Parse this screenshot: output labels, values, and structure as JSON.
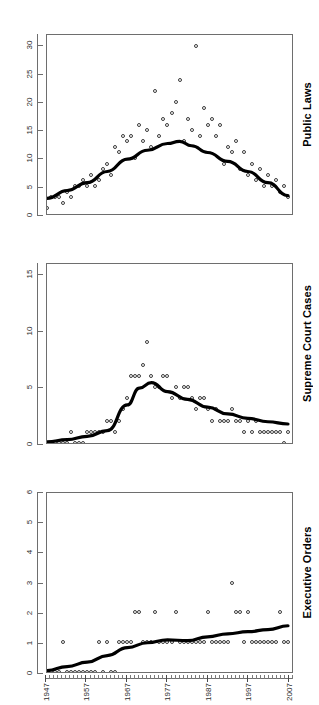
{
  "figure": {
    "orientation_note": "rotated-90",
    "background_color": "#ffffff",
    "point_color": "#3b3b3b",
    "trend_color": "#000000"
  },
  "chart_data": [
    {
      "type": "scatter",
      "title": "Executive Orders",
      "xlabel": "",
      "ylabel": "",
      "xlim": [
        1947,
        2008
      ],
      "ylim": [
        0,
        6
      ],
      "xticks": [
        1947,
        1957,
        1967,
        1977,
        1987,
        1997,
        2007
      ],
      "xticklabels": [
        "1947",
        "1957",
        "1967",
        "1977",
        "1987",
        "1997",
        "2007"
      ],
      "yticks": [
        0,
        1,
        2,
        3,
        4,
        5,
        6
      ],
      "yticklabels": [
        "0",
        "1",
        "2",
        "3",
        "4",
        "5",
        "6"
      ],
      "grid": false,
      "legend": "none",
      "series": [
        {
          "name": "observations",
          "marker": "open-circle",
          "x": [
            1947,
            1948,
            1949,
            1950,
            1951,
            1952,
            1953,
            1954,
            1955,
            1956,
            1957,
            1958,
            1959,
            1960,
            1961,
            1962,
            1963,
            1964,
            1965,
            1966,
            1967,
            1968,
            1969,
            1970,
            1971,
            1972,
            1973,
            1974,
            1975,
            1976,
            1977,
            1978,
            1979,
            1980,
            1981,
            1982,
            1983,
            1984,
            1985,
            1986,
            1987,
            1988,
            1989,
            1990,
            1991,
            1992,
            1993,
            1994,
            1995,
            1996,
            1997,
            1998,
            1999,
            2000,
            2001,
            2002,
            2003,
            2004,
            2005,
            2006,
            2007
          ],
          "y": [
            0,
            0,
            0,
            0,
            1,
            0,
            0,
            0,
            0,
            0,
            0,
            0,
            0,
            1,
            0,
            1,
            0,
            0,
            1,
            1,
            1,
            1,
            2,
            2,
            1,
            1,
            1,
            2,
            1,
            1,
            1,
            1,
            2,
            1,
            1,
            1,
            1,
            1,
            1,
            1,
            2,
            1,
            1,
            1,
            1,
            1,
            3,
            2,
            2,
            1,
            2,
            1,
            1,
            1,
            1,
            1,
            1,
            1,
            2,
            1,
            1
          ]
        },
        {
          "name": "smoothed-trend",
          "style": "thick-black-line",
          "x": [
            1947,
            1952,
            1957,
            1962,
            1967,
            1972,
            1977,
            1982,
            1987,
            1992,
            1997,
            2002,
            2007
          ],
          "y": [
            0.05,
            0.18,
            0.33,
            0.55,
            0.82,
            0.98,
            1.08,
            1.05,
            1.18,
            1.28,
            1.35,
            1.42,
            1.55
          ]
        }
      ]
    },
    {
      "type": "scatter",
      "title": "Supreme Court Cases",
      "xlabel": "",
      "ylabel": "",
      "xlim": [
        1947,
        2008
      ],
      "ylim": [
        0,
        16
      ],
      "xticks": [
        1947,
        1957,
        1967,
        1977,
        1987,
        1997,
        2007
      ],
      "xticklabels": [
        "1947",
        "1957",
        "1967",
        "1977",
        "1987",
        "1997",
        "2007"
      ],
      "yticks": [
        0,
        5,
        10,
        15
      ],
      "yticklabels": [
        "0",
        "5",
        "10",
        "15"
      ],
      "grid": false,
      "legend": "none",
      "series": [
        {
          "name": "observations",
          "marker": "open-circle",
          "x": [
            1947,
            1948,
            1949,
            1950,
            1951,
            1952,
            1953,
            1954,
            1955,
            1956,
            1957,
            1958,
            1959,
            1960,
            1961,
            1962,
            1963,
            1964,
            1965,
            1966,
            1967,
            1968,
            1969,
            1970,
            1971,
            1972,
            1973,
            1974,
            1975,
            1976,
            1977,
            1978,
            1979,
            1980,
            1981,
            1982,
            1983,
            1984,
            1985,
            1986,
            1987,
            1988,
            1989,
            1990,
            1991,
            1992,
            1993,
            1994,
            1995,
            1996,
            1997,
            1998,
            1999,
            2000,
            2001,
            2002,
            2003,
            2004,
            2005,
            2006,
            2007
          ],
          "y": [
            0,
            0,
            0,
            0,
            0,
            0,
            1,
            0,
            0,
            0,
            1,
            1,
            1,
            1,
            1,
            2,
            2,
            1,
            2,
            3,
            4,
            6,
            6,
            6,
            7,
            9,
            6,
            5,
            5,
            6,
            6,
            4,
            5,
            4,
            5,
            5,
            4,
            3,
            4,
            4,
            3,
            2,
            3,
            2,
            2,
            2,
            3,
            2,
            2,
            1,
            2,
            1,
            2,
            1,
            1,
            1,
            1,
            1,
            1,
            0,
            1
          ]
        },
        {
          "name": "smoothed-trend",
          "style": "thick-black-line",
          "x": [
            1947,
            1952,
            1957,
            1962,
            1967,
            1970,
            1973,
            1977,
            1982,
            1987,
            1992,
            1997,
            2002,
            2007
          ],
          "y": [
            0.1,
            0.3,
            0.6,
            1.1,
            3.4,
            4.9,
            5.4,
            4.6,
            3.9,
            3.2,
            2.6,
            2.2,
            1.9,
            1.7
          ]
        }
      ]
    },
    {
      "type": "scatter",
      "title": "Public Laws",
      "xlabel": "",
      "ylabel": "",
      "xlim": [
        1947,
        2008
      ],
      "ylim": [
        0,
        32
      ],
      "xticks": [
        1947,
        1957,
        1967,
        1977,
        1987,
        1997,
        2007
      ],
      "xticklabels": [
        "1947",
        "1957",
        "1967",
        "1977",
        "1987",
        "1997",
        "2007"
      ],
      "yticks": [
        0,
        5,
        10,
        15,
        20,
        25,
        30
      ],
      "yticklabels": [
        "0",
        "5",
        "10",
        "15",
        "20",
        "25",
        "30"
      ],
      "grid": false,
      "legend": "none",
      "series": [
        {
          "name": "observations",
          "marker": "open-circle",
          "x": [
            1947,
            1948,
            1949,
            1950,
            1951,
            1952,
            1953,
            1954,
            1955,
            1956,
            1957,
            1958,
            1959,
            1960,
            1961,
            1962,
            1963,
            1964,
            1965,
            1966,
            1967,
            1968,
            1969,
            1970,
            1971,
            1972,
            1973,
            1974,
            1975,
            1976,
            1977,
            1978,
            1979,
            1980,
            1981,
            1982,
            1983,
            1984,
            1985,
            1986,
            1987,
            1988,
            1989,
            1990,
            1991,
            1992,
            1993,
            1994,
            1995,
            1996,
            1997,
            1998,
            1999,
            2000,
            2001,
            2002,
            2003,
            2004,
            2005,
            2006,
            2007
          ],
          "y": [
            1,
            3,
            3,
            3,
            2,
            4,
            3,
            5,
            5,
            6,
            5,
            7,
            5,
            6,
            8,
            9,
            7,
            12,
            11,
            14,
            13,
            14,
            10,
            16,
            13,
            15,
            12,
            22,
            14,
            17,
            16,
            18,
            20,
            24,
            13,
            17,
            15,
            30,
            14,
            19,
            16,
            17,
            14,
            16,
            9,
            12,
            11,
            13,
            8,
            11,
            7,
            9,
            6,
            8,
            5,
            7,
            5,
            6,
            4,
            5,
            3
          ]
        },
        {
          "name": "smoothed-trend",
          "style": "thick-black-line",
          "x": [
            1947,
            1952,
            1957,
            1962,
            1967,
            1972,
            1977,
            1980,
            1983,
            1987,
            1992,
            1997,
            2002,
            2007
          ],
          "y": [
            2.8,
            4.2,
            5.6,
            7.6,
            9.8,
            11.4,
            12.6,
            13.0,
            12.2,
            11.0,
            9.4,
            7.6,
            5.6,
            3.3
          ]
        }
      ]
    }
  ]
}
